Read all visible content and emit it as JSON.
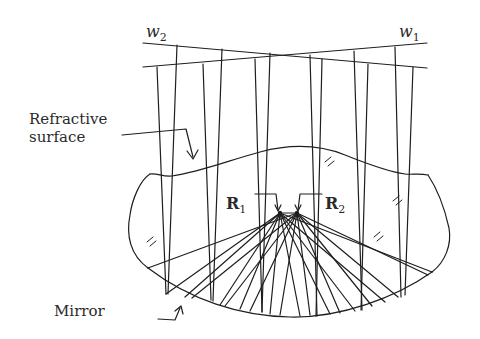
{
  "labels": {
    "refractive_surface_line1": "Refractive",
    "refractive_surface_line2": "surface",
    "mirror": "Mirror",
    "w2_base": "w",
    "w2_sub": "2",
    "w1_base": "w",
    "w1_sub": "1",
    "r1_base": "R",
    "r1_sub": "1",
    "r2_base": "R",
    "r2_sub": "2"
  },
  "colors": {
    "stroke": "#1e1e1e",
    "background": "#ffffff"
  },
  "geometry": {
    "wavefront_w2": {
      "x1": 143,
      "y1": 43,
      "x2": 427,
      "y2": 68
    },
    "wavefront_w1": {
      "x1": 143,
      "y1": 67,
      "x2": 427,
      "y2": 43
    },
    "focus_r1": [
      280,
      213
    ],
    "focus_r2": [
      297,
      213
    ]
  }
}
